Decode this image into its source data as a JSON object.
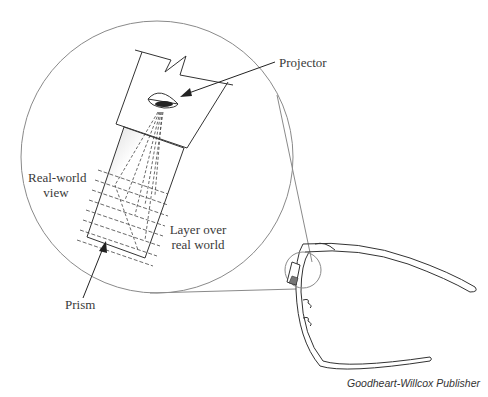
{
  "diagram": {
    "labels": {
      "projector": "Projector",
      "real_world_view_line1": "Real-world",
      "real_world_view_line2": "view",
      "layer_line1": "Layer over",
      "layer_line2": "real world",
      "prism": "Prism"
    },
    "credit": "Goodheart-Willcox Publisher",
    "colors": {
      "line": "#555555",
      "circle": "#8a8a8a",
      "text": "#3a3a3a"
    }
  }
}
